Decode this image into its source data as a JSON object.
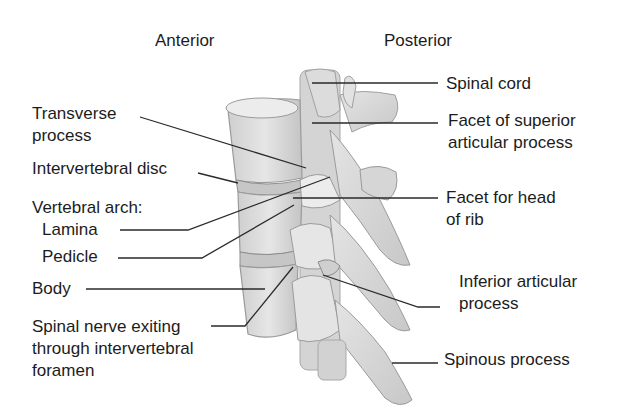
{
  "diagram": {
    "orientation": {
      "left": "Anterior",
      "right": "Posterior"
    },
    "left_labels": {
      "transverse_process": [
        "Transverse",
        "process"
      ],
      "intervertebral_disc": "Intervertebral disc",
      "vertebral_arch": "Vertebral arch:",
      "lamina": "Lamina",
      "pedicle": "Pedicle",
      "body": "Body",
      "spinal_nerve": [
        "Spinal nerve exiting",
        "through intervertebral",
        "foramen"
      ]
    },
    "right_labels": {
      "spinal_cord": "Spinal cord",
      "facet_superior": [
        "Facet of superior",
        "articular process"
      ],
      "facet_rib": [
        "Facet for head",
        "of rib"
      ],
      "inferior_articular": [
        "Inferior articular",
        "process"
      ],
      "spinous_process": "Spinous process"
    },
    "colors": {
      "bone_fill": "#d9d9d9",
      "bone_light": "#e8e8e8",
      "bone_shadow": "#bdbdbd",
      "outline": "#8a8a8a",
      "leader_line": "#2a2a2a",
      "text": "#1c1c1c"
    }
  }
}
